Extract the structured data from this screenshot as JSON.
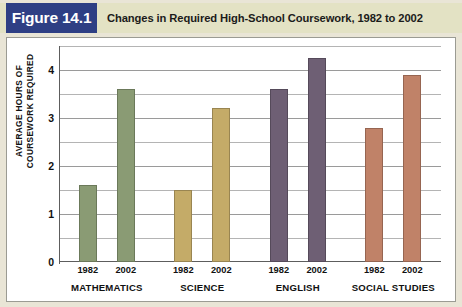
{
  "figure": {
    "number_label": "Figure 14.1",
    "caption": "Changes in Required High-School Coursework, 1982 to 2002",
    "number_box_color": "#2e3f84",
    "title_strip_color": "#e3e2c4",
    "panel_background": "#ffffff",
    "page_background": "#e9e5d6"
  },
  "chart_data": {
    "type": "bar",
    "title": "Changes in Required High-School Coursework, 1982 to 2002",
    "xlabel": "",
    "ylabel": "AVERAGE HOURS OF COURSEWORK REQUIRED",
    "ylim": [
      0,
      4.5
    ],
    "y_tick_labels": [
      "0",
      "1",
      "2",
      "3",
      "4"
    ],
    "y_ticks": [
      0,
      1,
      2,
      3,
      4
    ],
    "gridlines": [
      0.5,
      1,
      1.5,
      2,
      2.5,
      3,
      3.5,
      4,
      4.5
    ],
    "grid": true,
    "legend": "none",
    "categories": [
      "MATHEMATICS",
      "SCIENCE",
      "ENGLISH",
      "SOCIAL STUDIES"
    ],
    "series": [
      {
        "name": "1982",
        "values": [
          1.6,
          1.5,
          3.6,
          2.8
        ]
      },
      {
        "name": "2002",
        "values": [
          3.6,
          3.2,
          4.25,
          3.9
        ]
      }
    ],
    "group_colors": [
      "#8a9b74",
      "#c4ab68",
      "#6e5f74",
      "#c08268"
    ],
    "bars": [
      {
        "group": "MATHEMATICS",
        "year": "1982",
        "value": 1.6,
        "color": "#8a9b74"
      },
      {
        "group": "MATHEMATICS",
        "year": "2002",
        "value": 3.6,
        "color": "#8a9b74"
      },
      {
        "group": "SCIENCE",
        "year": "1982",
        "value": 1.5,
        "color": "#c4ab68"
      },
      {
        "group": "SCIENCE",
        "year": "2002",
        "value": 3.2,
        "color": "#c4ab68"
      },
      {
        "group": "ENGLISH",
        "year": "1982",
        "value": 3.6,
        "color": "#6e5f74"
      },
      {
        "group": "ENGLISH",
        "year": "2002",
        "value": 4.25,
        "color": "#6e5f74"
      },
      {
        "group": "SOCIAL STUDIES",
        "year": "1982",
        "value": 2.8,
        "color": "#c08268"
      },
      {
        "group": "SOCIAL STUDIES",
        "year": "2002",
        "value": 3.9,
        "color": "#c08268"
      }
    ]
  }
}
